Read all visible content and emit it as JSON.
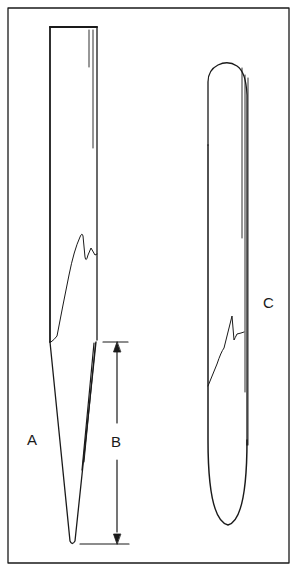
{
  "diagram": {
    "type": "technical-illustration",
    "stroke_color": "#1a1a1a",
    "background": "#ffffff",
    "labels": {
      "a": "A",
      "b": "B",
      "c": "C"
    },
    "parts": [
      {
        "id": "A",
        "description": "tapered-tip tube with break/crack line"
      },
      {
        "id": "B",
        "description": "dimension arrow indicating taper length"
      },
      {
        "id": "C",
        "description": "round-ended tube with break/crack line"
      }
    ]
  }
}
